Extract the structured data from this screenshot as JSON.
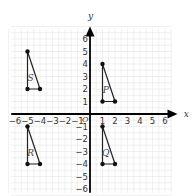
{
  "diagram": {
    "type": "coordinate-plane",
    "axes": {
      "x_label": "x",
      "y_label": "y",
      "origin_label": "O",
      "x_range": [
        -6,
        6
      ],
      "y_range": [
        -6,
        6
      ]
    },
    "x_ticks": [
      "-6",
      "-5",
      "-4",
      "-3",
      "-2",
      "-1",
      "1",
      "2",
      "3",
      "4",
      "5",
      "6"
    ],
    "y_ticks": [
      "6",
      "5",
      "4",
      "3",
      "2",
      "1",
      "-1",
      "-2",
      "-3",
      "-4",
      "-5",
      "-6"
    ],
    "triangles": [
      {
        "label": "S",
        "vertices": [
          [
            -5,
            5
          ],
          [
            -5,
            2
          ],
          [
            -4,
            2
          ]
        ]
      },
      {
        "label": "P",
        "vertices": [
          [
            1,
            4
          ],
          [
            1,
            1
          ],
          [
            2,
            1
          ]
        ]
      },
      {
        "label": "R",
        "vertices": [
          [
            -5,
            -1
          ],
          [
            -5,
            -4
          ],
          [
            -4,
            -4
          ]
        ]
      },
      {
        "label": "Q",
        "vertices": [
          [
            1,
            -1
          ],
          [
            1,
            -4
          ],
          [
            2,
            -4
          ]
        ]
      }
    ]
  }
}
